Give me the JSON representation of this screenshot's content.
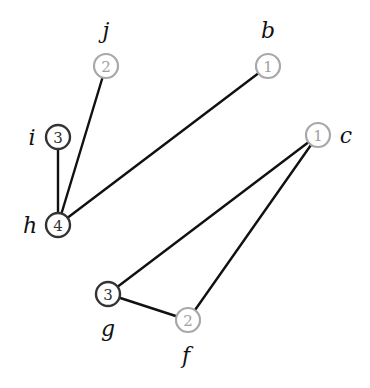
{
  "graph": {
    "nodes": [
      {
        "id": "j",
        "label": "j",
        "value": "2",
        "style": "light",
        "x": 106,
        "y": 66,
        "lx": 106,
        "ly": 30
      },
      {
        "id": "b",
        "label": "b",
        "value": "1",
        "style": "light",
        "x": 268,
        "y": 66,
        "lx": 268,
        "ly": 30
      },
      {
        "id": "i",
        "label": "i",
        "value": "3",
        "style": "dark",
        "x": 58,
        "y": 137,
        "lx": 32,
        "ly": 137
      },
      {
        "id": "c",
        "label": "c",
        "value": "1",
        "style": "light",
        "x": 318,
        "y": 135,
        "lx": 346,
        "ly": 135
      },
      {
        "id": "h",
        "label": "h",
        "value": "4",
        "style": "dark",
        "x": 58,
        "y": 225,
        "lx": 30,
        "ly": 225
      },
      {
        "id": "g",
        "label": "g",
        "value": "3",
        "style": "dark",
        "x": 108,
        "y": 294,
        "lx": 108,
        "ly": 328
      },
      {
        "id": "f",
        "label": "f",
        "value": "2",
        "style": "light",
        "x": 188,
        "y": 320,
        "lx": 186,
        "ly": 355
      }
    ],
    "edges": [
      {
        "from": "i",
        "to": "h"
      },
      {
        "from": "j",
        "to": "h"
      },
      {
        "from": "b",
        "to": "h"
      },
      {
        "from": "c",
        "to": "g"
      },
      {
        "from": "c",
        "to": "f"
      },
      {
        "from": "g",
        "to": "f"
      }
    ],
    "node_radius": 12,
    "colors": {
      "edge": "#111111",
      "dark_node": "#333333",
      "light_node": "#a8a8a8"
    }
  }
}
